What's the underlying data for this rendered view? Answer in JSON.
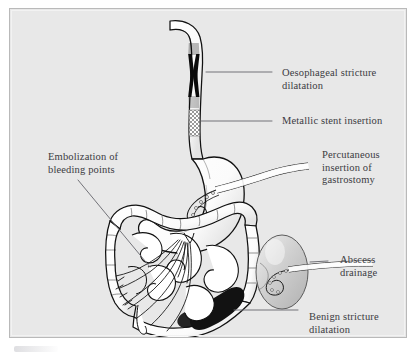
{
  "figure": {
    "frame": {
      "background_color": "#e8e8e8",
      "border_color": "#b9b9b9",
      "page_color": "#ffffff"
    },
    "text_color": "#3b3b42",
    "leader_line_color": "#6b6b72"
  },
  "labels": [
    {
      "id": "oesophageal-stricture-dilatation",
      "text": "Oesophageal stricture\ndilatation",
      "x": 272,
      "y": 58,
      "target": "esophageal stricture (dark narrowing in upper oesophagus)"
    },
    {
      "id": "metallic-stent-insertion",
      "text": "Metallic stent insertion",
      "x": 272,
      "y": 106,
      "target": "mesh-patterned stent in mid oesophagus"
    },
    {
      "id": "percutaneous-insertion-of-gastrostomy",
      "text": "Percutaneous\ninsertion of\ngastrostomy",
      "x": 312,
      "y": 140,
      "target": "pigtail catheter within the stomach"
    },
    {
      "id": "embolization-of-bleeding-points",
      "text": "Embolization of\nbleeding points",
      "x": 38,
      "y": 142,
      "target": "mesenteric vessels of small bowel"
    },
    {
      "id": "abscess-drainage",
      "text": "Abscess\ndrainage",
      "x": 330,
      "y": 245,
      "target": "pigtail drain within abscess collection"
    },
    {
      "id": "benign-stricture-dilatation",
      "text": "Benign stricture\ndilatation",
      "x": 299,
      "y": 302,
      "target": "dark narrowing at rectosigmoid"
    }
  ],
  "anatomy": [
    {
      "id": "oesophagus",
      "label": "Oesophagus",
      "fill": "#ffffff",
      "stroke": "#111111"
    },
    {
      "id": "oesophageal-stricture",
      "label": "Oesophageal stricture",
      "fill": "#000000"
    },
    {
      "id": "metallic-stent",
      "label": "Metallic stent",
      "fill": "#b5b5b5",
      "pattern": "checker-mesh"
    },
    {
      "id": "stomach",
      "label": "Stomach",
      "fill": "#ffffff",
      "stroke": "#111111"
    },
    {
      "id": "duodenum",
      "label": "Duodenum",
      "fill": "#ffffff",
      "stroke": "#111111"
    },
    {
      "id": "small-bowel",
      "label": "Small bowel loops",
      "fill": "#ffffff",
      "stroke": "#111111"
    },
    {
      "id": "colon",
      "label": "Colon (haustrated)",
      "fill": "#ffffff",
      "stroke": "#111111"
    },
    {
      "id": "rectum",
      "label": "Rectum",
      "fill": "#ffffff",
      "stroke": "#111111"
    },
    {
      "id": "benign-stricture",
      "label": "Benign stricture",
      "fill": "#1a1a1a"
    },
    {
      "id": "abscess-collection",
      "label": "Abscess collection",
      "fill": "#c9c9c9",
      "stroke": "#555555"
    },
    {
      "id": "mesenteric-vessels",
      "label": "Mesenteric vessels",
      "stroke": "#111111"
    }
  ],
  "devices": [
    {
      "id": "gastrostomy-catheter",
      "label": "Gastrostomy catheter",
      "shape": "pigtail"
    },
    {
      "id": "abscess-drain-catheter",
      "label": "Abscess drainage catheter",
      "shape": "pigtail"
    }
  ]
}
